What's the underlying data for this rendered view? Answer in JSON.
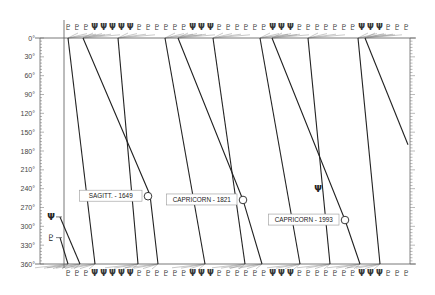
{
  "chart_data": {
    "type": "line",
    "title": "",
    "xlabel": "",
    "ylabel": "",
    "ylim": [
      0,
      360
    ],
    "y_ticks": [
      "0°",
      "30°",
      "60°",
      "90°",
      "120°",
      "150°",
      "180°",
      "210°",
      "240°",
      "270°",
      "300°",
      "330°",
      "360°"
    ],
    "y_inverted": true,
    "grid": false,
    "legend": null,
    "symbols": {
      "neptune": "Ψ",
      "pluto": "♇"
    },
    "top_symbol_row": [
      "♇",
      "♇",
      "♇",
      "Ψ",
      "Ψ",
      "Ψ",
      "Ψ",
      "Ψ",
      "♇",
      "♇",
      "♇",
      "♇",
      "♇",
      "♇",
      "Ψ",
      "Ψ",
      "Ψ",
      "♇",
      "♇",
      "♇",
      "♇",
      "♇",
      "♇",
      "Ψ",
      "Ψ",
      "Ψ",
      "♇",
      "♇",
      "♇",
      "♇",
      "♇",
      "♇",
      "♇",
      "Ψ",
      "Ψ",
      "Ψ",
      "♇",
      "♇",
      "♇"
    ],
    "bottom_symbol_row": [
      "♇",
      "♇",
      "♇",
      "Ψ",
      "Ψ",
      "Ψ",
      "Ψ",
      "Ψ",
      "♇",
      "♇",
      "♇",
      "♇",
      "♇",
      "♇",
      "Ψ",
      "Ψ",
      "Ψ",
      "♇",
      "♇",
      "♇",
      "♇",
      "♇",
      "♇",
      "Ψ",
      "Ψ",
      "Ψ",
      "♇",
      "♇",
      "♇",
      "♇",
      "♇",
      "♇",
      "♇",
      "Ψ",
      "Ψ",
      "Ψ",
      "♇",
      "♇",
      "♇"
    ],
    "side_symbols": [
      {
        "symbol": "Ψ",
        "y_deg": 285
      },
      {
        "symbol": "♇",
        "y_deg": 318
      }
    ],
    "series": [
      {
        "name": "line-1",
        "points": [
          [
            68,
            0
          ],
          [
            95,
            360
          ]
        ]
      },
      {
        "name": "line-2",
        "points": [
          [
            83,
            0
          ],
          [
            150,
            250
          ],
          [
            158,
            360
          ]
        ]
      },
      {
        "name": "line-3",
        "points": [
          [
            118,
            0
          ],
          [
            138,
            360
          ]
        ]
      },
      {
        "name": "line-4",
        "points": [
          [
            165,
            0
          ],
          [
            205,
            360
          ]
        ]
      },
      {
        "name": "line-5",
        "points": [
          [
            178,
            0
          ],
          [
            243,
            258
          ],
          [
            262,
            360
          ]
        ]
      },
      {
        "name": "line-6",
        "points": [
          [
            213,
            0
          ],
          [
            245,
            360
          ]
        ]
      },
      {
        "name": "line-7",
        "points": [
          [
            260,
            0
          ],
          [
            300,
            360
          ]
        ]
      },
      {
        "name": "line-8",
        "points": [
          [
            272,
            0
          ],
          [
            345,
            290
          ],
          [
            360,
            360
          ]
        ]
      },
      {
        "name": "line-9",
        "points": [
          [
            308,
            0
          ],
          [
            330,
            360
          ]
        ]
      },
      {
        "name": "line-10",
        "points": [
          [
            358,
            0
          ],
          [
            380,
            360
          ]
        ]
      },
      {
        "name": "line-11",
        "points": [
          [
            365,
            0
          ],
          [
            408,
            170
          ]
        ]
      },
      {
        "name": "line-12",
        "points": [
          [
            60,
            285
          ],
          [
            80,
            360
          ]
        ]
      },
      {
        "name": "line-13",
        "points": [
          [
            60,
            318
          ],
          [
            68,
            360
          ]
        ]
      }
    ],
    "annotations": [
      {
        "label": "SAGITT. - 1649",
        "x": 148,
        "y_deg": 252
      },
      {
        "label": "CAPRICORN - 1821",
        "x": 243,
        "y_deg": 258
      },
      {
        "label": "CAPRICORN - 1993",
        "x": 345,
        "y_deg": 290
      }
    ],
    "free_symbol": {
      "symbol": "Ψ",
      "x": 318,
      "y_deg": 240
    }
  }
}
